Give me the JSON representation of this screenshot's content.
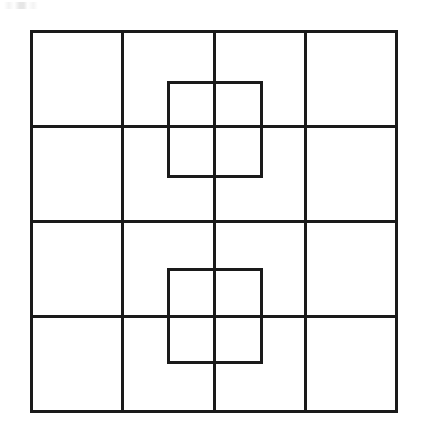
{
  "figure": {
    "canvas": {
      "width": 423,
      "height": 443,
      "background": "#ffffff"
    },
    "stroke": {
      "color": "#1a1a1a",
      "outer_width": 3,
      "grid_width": 3,
      "inner_width": 3
    },
    "outer_square": {
      "name": "outer-square",
      "x": 31,
      "y": 31,
      "width": 365,
      "height": 380
    },
    "grid": {
      "columns": 4,
      "rows": 4,
      "vertical_lines_x": [
        122,
        214,
        305
      ],
      "horizontal_lines_y": [
        126,
        221,
        316
      ]
    },
    "inner_squares": [
      {
        "name": "upper-inner-square",
        "label": "Upper overlay square",
        "x": 168,
        "y": 82,
        "width": 93,
        "height": 94
      },
      {
        "name": "lower-inner-square",
        "label": "Lower overlay square",
        "x": 168,
        "y": 269,
        "width": 93,
        "height": 93
      }
    ]
  },
  "chart_data": {
    "type": "diagram",
    "xlabel": "",
    "ylabel": "",
    "shapes": [
      {
        "kind": "rect",
        "role": "outer-boundary",
        "x": 31,
        "y": 31,
        "w": 365,
        "h": 380
      },
      {
        "kind": "line",
        "role": "grid-vertical",
        "x1": 122,
        "y1": 31,
        "x2": 122,
        "y2": 411
      },
      {
        "kind": "line",
        "role": "grid-vertical",
        "x1": 214,
        "y1": 31,
        "x2": 214,
        "y2": 411
      },
      {
        "kind": "line",
        "role": "grid-vertical",
        "x1": 305,
        "y1": 31,
        "x2": 305,
        "y2": 411
      },
      {
        "kind": "line",
        "role": "grid-horizontal",
        "x1": 31,
        "y1": 126,
        "x2": 396,
        "y2": 126
      },
      {
        "kind": "line",
        "role": "grid-horizontal",
        "x1": 31,
        "y1": 221,
        "x2": 396,
        "y2": 221
      },
      {
        "kind": "line",
        "role": "grid-horizontal",
        "x1": 31,
        "y1": 316,
        "x2": 396,
        "y2": 316
      },
      {
        "kind": "rect",
        "role": "overlay-square-upper",
        "x": 168,
        "y": 82,
        "w": 93,
        "h": 94
      },
      {
        "kind": "rect",
        "role": "overlay-square-lower",
        "x": 168,
        "y": 269,
        "w": 93,
        "h": 93
      }
    ],
    "counts": {
      "grid_cells": 16,
      "overlay_squares": 2
    }
  }
}
